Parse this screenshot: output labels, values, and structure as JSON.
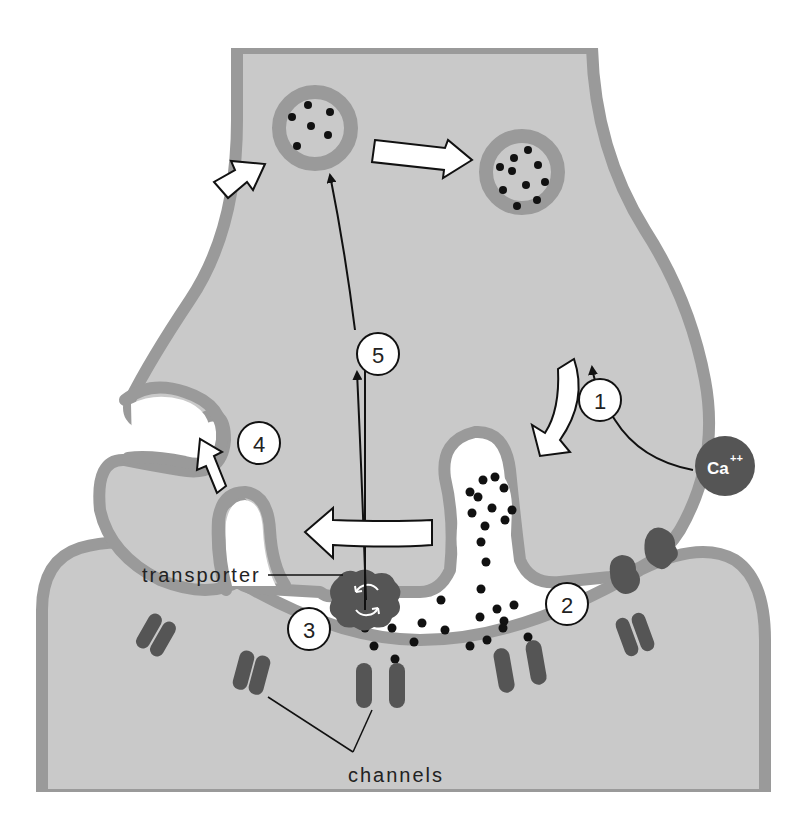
{
  "diagram": {
    "colors": {
      "background": "#ffffff",
      "cytoplasm": "#c9c9c9",
      "membrane": "#9a9a9a",
      "protein": "#555555",
      "neurotransmitter": "#111111",
      "arrow_fill": "#ffffff",
      "arrow_stroke": "#111111"
    },
    "labels": {
      "transporter": "transporter",
      "channels": "channels",
      "calcium": "Ca",
      "calcium_charge": "++"
    },
    "steps": [
      {
        "id": 1,
        "label": "1"
      },
      {
        "id": 2,
        "label": "2"
      },
      {
        "id": 3,
        "label": "3"
      },
      {
        "id": 4,
        "label": "4"
      },
      {
        "id": 5,
        "label": "5"
      }
    ],
    "components": [
      "presynaptic-terminal",
      "postsynaptic-cell",
      "synaptic-cleft",
      "vesicle-filled-left",
      "vesicle-filled-right",
      "fusing-vesicle",
      "transporter-protein",
      "calcium-channels",
      "receptor-channels",
      "calcium-ion"
    ],
    "caption_fragment": "The ... "
  }
}
